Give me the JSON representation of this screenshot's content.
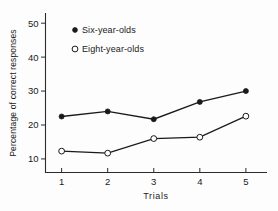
{
  "chart_data": {
    "type": "line",
    "title": "",
    "xlabel": "Trials",
    "ylabel": "Percentage of correct responses",
    "categories": [
      "1",
      "2",
      "3",
      "4",
      "5"
    ],
    "x": [
      1,
      2,
      3,
      4,
      5
    ],
    "xlim": [
      0.65,
      5.35
    ],
    "ylim": [
      6,
      53
    ],
    "xticks": [
      "1",
      "2",
      "3",
      "4",
      "5"
    ],
    "yticks": [
      "10",
      "20",
      "30",
      "40",
      "50"
    ],
    "ytick_values": [
      10,
      20,
      30,
      40,
      50
    ],
    "grid": false,
    "legend_position": "upper-left-inside",
    "series": [
      {
        "name": "Six-year-olds",
        "marker": "filled-circle",
        "values": [
          22.5,
          24.0,
          21.7,
          26.8,
          30.0
        ]
      },
      {
        "name": "Eight-year-olds",
        "marker": "open-circle",
        "values": [
          12.3,
          11.7,
          16.0,
          16.4,
          22.6
        ]
      }
    ]
  },
  "legend": {
    "entries": [
      {
        "label": "Six-year-olds",
        "marker": "filled-circle"
      },
      {
        "label": "Eight-year-olds",
        "marker": "open-circle"
      }
    ]
  },
  "colors": {
    "ink": "#1a1a1a",
    "axis": "#2b2b2b",
    "background": "#fdfdfd",
    "marker_fill_open": "#ffffff"
  }
}
